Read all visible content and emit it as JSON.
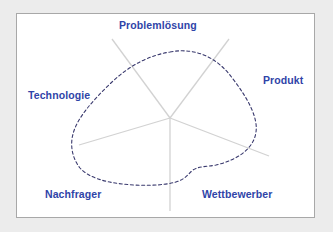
{
  "diagram": {
    "title_label": "Problemlösung",
    "type": "radial-axis-profile-diagram",
    "frame": {
      "background_color": "#ffffff",
      "border_color": "#a8a8a8",
      "outer_background_color": "#ececec"
    },
    "colors": {
      "label_text": "#2f44a8",
      "axis_line": "#d2d2d2",
      "profile_curve": "#3a3a6e",
      "frame_border": "#a8a8a8",
      "canvas": "#ffffff"
    },
    "center": {
      "x": 170,
      "y": 118
    },
    "axes": [
      {
        "id": "problemloesung",
        "label": "Problemlösung",
        "direction": "top-left-diagonal",
        "endpoint": {
          "x": 112,
          "y": 39
        },
        "label_position": {
          "x": 119,
          "y": 19
        }
      },
      {
        "id": "produkt",
        "label": "Produkt",
        "direction": "upper-right-diagonal",
        "endpoint": {
          "x": 229,
          "y": 39
        },
        "label_position": {
          "x": 263,
          "y": 74
        }
      },
      {
        "id": "technologie",
        "label": "Technologie",
        "direction": "left",
        "endpoint": {
          "x": 79,
          "y": 145
        },
        "label_position": {
          "x": 28,
          "y": 89
        }
      },
      {
        "id": "wettbewerber",
        "label": "Wettbewerber",
        "direction": "lower-right",
        "endpoint": {
          "x": 269,
          "y": 156
        },
        "label_position": {
          "x": 202,
          "y": 188
        }
      },
      {
        "id": "nachfrager",
        "label": "Nachfrager",
        "direction": "bottom-vertical",
        "endpoint": {
          "x": 170,
          "y": 211
        },
        "label_position": {
          "x": 45,
          "y": 188
        }
      }
    ],
    "profile_curve": {
      "style": "dashed",
      "closed": true,
      "dash_pattern": "3 2.6",
      "stroke_width": 1.1,
      "description": "Closed irregular blob outlining the competency profile across the five axes, with a concave notch near the lower-right between the Nachfrager and Wettbewerber axes.",
      "path": "M 170 52 C 196 47, 218 58, 233 79 C 249 100, 258 118, 256 132 C 254 148, 238 160, 216 165 C 206 167, 199 166, 193 170 C 188 174, 186 179, 176 182 C 162 186, 140 186, 122 184 C 104 182, 88 177, 80 168 C 72 158, 70 145, 73 134 C 77 118, 93 100, 112 82 C 131 64, 151 55, 170 52 Z"
    }
  }
}
